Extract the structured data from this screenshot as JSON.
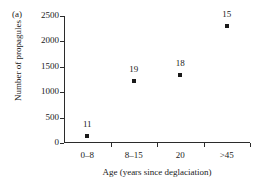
{
  "panel": {
    "label": "(a)"
  },
  "chart_data": {
    "type": "scatter",
    "title": "",
    "xlabel": "Age (years since deglaciation)",
    "ylabel": "Number of propagules",
    "categories": [
      "0–8",
      "8–15",
      "20",
      ">45"
    ],
    "values": [
      140,
      1230,
      1340,
      2300
    ],
    "point_labels": [
      "11",
      "19",
      "18",
      "15"
    ],
    "point_label_meaning": "sample size (n)",
    "ylim": [
      0,
      2500
    ],
    "yticks": [
      0,
      500,
      1000,
      1500,
      2000,
      2500
    ],
    "ytick_labels": [
      "0",
      "500",
      "1000",
      "1500",
      "2000",
      "2500"
    ],
    "xtick_labels": [
      "0–8",
      "8–15",
      "20",
      ">45"
    ],
    "grid": false,
    "legend": false,
    "marker": "square",
    "marker_color": "#1a1a1a",
    "axis_color": "#2b2b2b"
  }
}
